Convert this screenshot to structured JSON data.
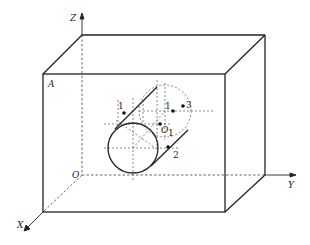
{
  "diagram": {
    "type": "3d-box-with-cylindrical-hole",
    "colors": {
      "line": "#222222",
      "dashed": "#444444",
      "background": "#ffffff"
    },
    "axes": {
      "z_label": "Z",
      "y_label": "Y",
      "x_label": "X",
      "origin_label": "O"
    },
    "labels": {
      "corner_a": "A",
      "center_o1": "O",
      "center_o1_sub": "1",
      "point_1_front": "1",
      "point_1_back": "1",
      "point_3": "3",
      "point_2": "2"
    }
  }
}
